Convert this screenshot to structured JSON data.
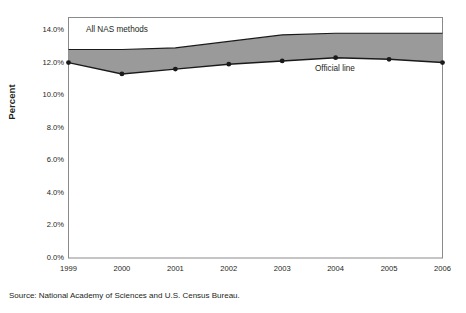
{
  "chart_data": {
    "type": "area",
    "title": "",
    "xlabel": "",
    "ylabel": "Percent",
    "categories": [
      "1999",
      "2000",
      "2001",
      "2002",
      "2003",
      "2004",
      "2005",
      "2006"
    ],
    "x": [
      1999,
      2000,
      2001,
      2002,
      2003,
      2004,
      2005,
      2006
    ],
    "ylim": [
      0.0,
      14.0
    ],
    "xlim": [
      1999,
      2006
    ],
    "ytick_labels": [
      "0.0%",
      "2.0%",
      "4.0%",
      "6.0%",
      "8.0%",
      "10.0%",
      "12.0%",
      "14.0%"
    ],
    "ytick_values": [
      0.0,
      2.0,
      4.0,
      6.0,
      8.0,
      10.0,
      12.0,
      14.0
    ],
    "grid": false,
    "legend_position": "inline-annotations",
    "series": [
      {
        "name": "Official line",
        "type": "line",
        "markers": true,
        "values": [
          12.0,
          11.3,
          11.6,
          11.9,
          12.1,
          12.3,
          12.2,
          12.0
        ]
      },
      {
        "name": "All NAS methods",
        "type": "band-upper",
        "markers": false,
        "values": [
          12.8,
          12.8,
          12.9,
          13.3,
          13.7,
          13.8,
          13.8,
          13.8
        ]
      }
    ],
    "band": {
      "label": "All NAS methods",
      "upper": [
        12.8,
        12.8,
        12.9,
        13.3,
        13.7,
        13.8,
        13.8,
        13.8
      ],
      "lower": [
        12.0,
        11.3,
        11.6,
        11.9,
        12.1,
        12.3,
        12.2,
        12.0
      ],
      "fill_color": "#9a9a9a"
    },
    "annotations": [
      {
        "text": "All NAS methods",
        "x": 1999.4,
        "y": 13.4
      },
      {
        "text": "Official line",
        "x": 2004.1,
        "y": 11.5
      }
    ],
    "colors": {
      "band_fill": "#9a9a9a",
      "line": "#1a1a1a",
      "axis": "#808080",
      "text": "#231f20"
    }
  },
  "axes": {
    "y_title": "Percent",
    "y_tick_labels": [
      "14.0%",
      "12.0%",
      "10.0%",
      "8.0%",
      "6.0%",
      "4.0%",
      "2.0%",
      "0.0%"
    ],
    "x_tick_labels": [
      "1999",
      "2000",
      "2001",
      "2002",
      "2003",
      "2004",
      "2005",
      "2006"
    ]
  },
  "annotations": {
    "band_label": "All NAS methods",
    "line_label": "Official line"
  },
  "footer": {
    "source": "Source: National Academy of Sciences and U.S. Census Bureau."
  }
}
